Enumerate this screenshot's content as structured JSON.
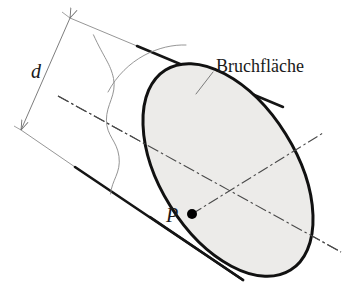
{
  "figure": {
    "kind": "technical-line-drawing",
    "background_color": "#ffffff",
    "labels": {
      "fracture_surface": "Bruchfläche",
      "diameter": "d",
      "point": "P"
    },
    "colors": {
      "outline": "#111111",
      "thin_line": "#777777",
      "centerline": "#444444",
      "fracture_fill": "#ecebe9",
      "point_marker": "#000000",
      "text": "#1a1a1a"
    },
    "geometry": {
      "ellipse": {
        "center_x": 228,
        "center_y": 170,
        "radius_major": 118,
        "radius_minor": 68,
        "rotation_deg": 58
      },
      "point_P": {
        "x": 192,
        "y": 214
      },
      "dimension_d": {
        "start_x": 70,
        "start_y": 18,
        "end_x": 21,
        "end_y": 130
      },
      "cylinder_top_edge": {
        "x1": 70,
        "y1": 18,
        "x2": 275,
        "y2": 103
      },
      "cylinder_bottom_edge": {
        "x1": 21,
        "y1": 130,
        "x2": 238,
        "y2": 275
      }
    },
    "line_styles": {
      "fracture_outline_width": 3.0,
      "cylinder_thick_width": 2.6,
      "cylinder_thin_width": 0.9,
      "centerline_width": 1.1,
      "centerline_dash": "11 3 2 3",
      "break_line_width": 0.9,
      "leader_line_width": 0.9,
      "dimension_line_width": 0.9
    }
  }
}
